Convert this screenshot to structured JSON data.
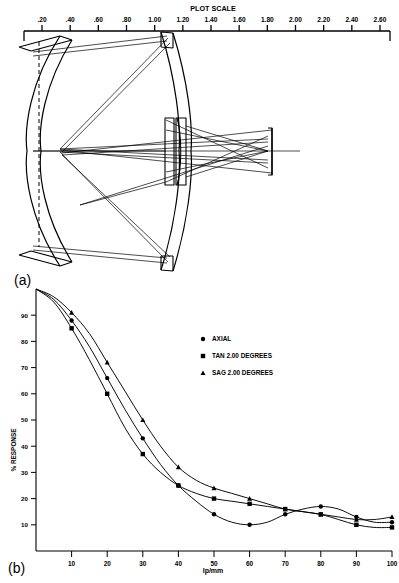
{
  "figure": {
    "panel_a_label": "(a)",
    "panel_b_label": "(b)"
  },
  "plot_scale": {
    "title": "PLOT SCALE",
    "ticks": [
      ".20",
      ".40",
      ".60",
      ".80",
      "1.00",
      "1.20",
      "1.40",
      "1.60",
      "1.80",
      "2.00",
      "2.20",
      "2.40",
      "2.60"
    ]
  },
  "lens_layout": {
    "name": "catadioptric-lens-raytrace-diagram",
    "elements": [
      "primary-mirror",
      "secondary-mirror",
      "corrector-lens-1",
      "corrector-lens-2",
      "image-plane"
    ]
  },
  "chart_data": {
    "type": "line",
    "title": "",
    "xlabel": "lp/mm",
    "ylabel": "% RESPONSE",
    "xlim": [
      0,
      100
    ],
    "ylim": [
      0,
      100
    ],
    "grid": false,
    "legend_position": "upper-right-inside",
    "xticks": [
      10,
      20,
      30,
      40,
      50,
      60,
      70,
      80,
      90,
      100
    ],
    "yticks": [
      10,
      20,
      30,
      40,
      50,
      60,
      70,
      80,
      90
    ],
    "x": [
      0,
      5,
      10,
      15,
      20,
      25,
      30,
      35,
      40,
      45,
      50,
      55,
      60,
      65,
      70,
      75,
      80,
      85,
      90,
      95,
      100
    ],
    "series": [
      {
        "name": "AXIAL",
        "marker": "circle",
        "label": "AXIAL",
        "values": [
          100,
          96,
          88,
          78,
          66,
          54,
          43,
          33,
          25,
          19,
          14,
          11,
          10,
          11,
          14,
          16,
          17,
          16,
          13,
          11,
          11
        ]
      },
      {
        "name": "TAN 2.00 DEGREES",
        "marker": "square",
        "label_prefix": "TAN",
        "label_value": "2.00 DEGREES",
        "label": "TAN  2.00 DEGREES",
        "values": [
          100,
          95,
          85,
          73,
          60,
          47,
          37,
          30,
          25,
          22,
          20,
          19,
          18,
          17,
          16,
          15,
          14,
          12,
          10,
          9,
          9
        ]
      },
      {
        "name": "SAG 2.00 DEGREES",
        "marker": "triangle",
        "label_prefix": "SAG",
        "label_value": "2.00 DEGREES",
        "label": "SAG  2.00 DEGREES",
        "values": [
          100,
          97,
          91,
          83,
          72,
          61,
          50,
          40,
          32,
          27,
          24,
          22,
          20,
          18,
          16,
          15,
          14,
          13,
          12,
          12,
          13
        ]
      }
    ]
  }
}
